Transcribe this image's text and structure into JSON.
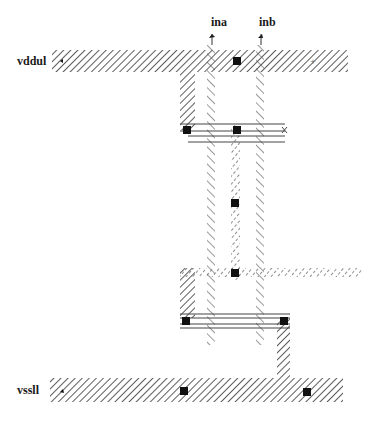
{
  "diagram": {
    "type": "cmos-layout-stick-diagram",
    "labels": {
      "vdd": "vddul",
      "vss": "vssll",
      "input_a": "ina",
      "input_b": "inb"
    },
    "colors": {
      "hatch": "#333333",
      "contact": "#111111",
      "wire": "#444444",
      "background": "#ffffff"
    },
    "rails": [
      {
        "name": "vddul",
        "y": 50,
        "x_start": 52,
        "x_end": 348,
        "height": 22
      },
      {
        "name": "vssll",
        "y": 378,
        "x_start": 50,
        "x_end": 343,
        "height": 24
      }
    ],
    "contacts": [
      {
        "id": "vdd-contact",
        "x": 237,
        "y": 61
      },
      {
        "id": "p-left-contact",
        "x": 187,
        "y": 130
      },
      {
        "id": "p-mid-contact",
        "x": 237,
        "y": 130
      },
      {
        "id": "mid-contact",
        "x": 235,
        "y": 203
      },
      {
        "id": "n-top-contact",
        "x": 235,
        "y": 273
      },
      {
        "id": "n-left-contact",
        "x": 186,
        "y": 321
      },
      {
        "id": "n-right-contact",
        "x": 284,
        "y": 321
      },
      {
        "id": "vss-contact-1",
        "x": 184,
        "y": 391
      },
      {
        "id": "vss-contact-2",
        "x": 307,
        "y": 392
      }
    ]
  }
}
